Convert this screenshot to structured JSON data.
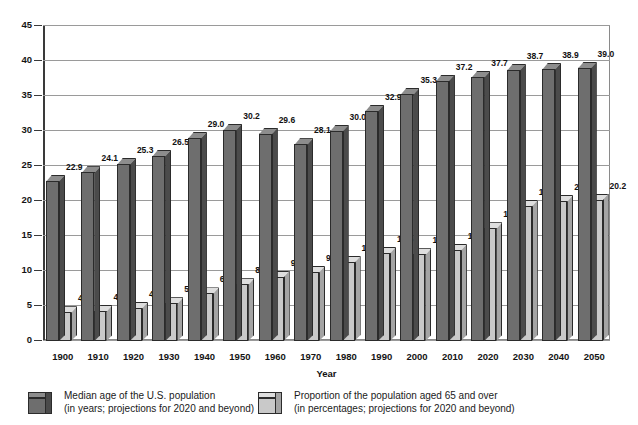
{
  "chart_data": {
    "type": "bar",
    "title": "",
    "subtitle": "",
    "xlabel": "Year",
    "ylabel": "",
    "ylim": [
      0,
      45
    ],
    "grid": true,
    "legend_position": "bottom",
    "categories": [
      "1900",
      "1910",
      "1920",
      "1930",
      "1940",
      "1950",
      "1960",
      "1970",
      "1980",
      "1990",
      "2000",
      "2010",
      "2020",
      "2030",
      "2040",
      "2050"
    ],
    "yticks": [
      "0",
      "5",
      "10",
      "15",
      "20",
      "25",
      "30",
      "35",
      "40",
      "45"
    ],
    "series": [
      {
        "name": "Median age of the U.S. population",
        "note": "(in years; projections for 2020 and beyond)",
        "color": "#6e6e6e",
        "values": [
          22.9,
          24.1,
          25.3,
          26.5,
          29.0,
          30.2,
          29.6,
          28.1,
          30.0,
          32.9,
          35.3,
          37.2,
          37.7,
          38.7,
          38.9,
          39.0
        ],
        "labels": [
          "22.9",
          "24.1",
          "25.3",
          "26.5",
          "29.0",
          "30.2",
          "29.6",
          "28.1",
          "30.0",
          "32.9",
          "35.3",
          "37.2",
          "37.7",
          "38.7",
          "38.9",
          "39.0"
        ]
      },
      {
        "name": "Proportion of the population aged 65 and over",
        "note": "(in percentages; projections for 2020 and beyond)",
        "color": "#c9c9c9",
        "values": [
          4.1,
          4.3,
          4.7,
          5.4,
          6.8,
          8.1,
          9.2,
          9.9,
          11.3,
          12.6,
          12.4,
          13.0,
          16.1,
          19.3,
          20.0,
          20.2
        ],
        "labels": [
          "4.1",
          "4.3",
          "4.7",
          "5.4",
          "6.8",
          "8.1",
          "9.2",
          "9.9",
          "11.3",
          "12.6",
          "12.4",
          "13.0",
          "16.1",
          "19.3",
          "20.0",
          "20.2"
        ]
      }
    ]
  },
  "axis": {
    "x_title": "Year"
  },
  "legend": {
    "items": [
      {
        "line1": "Median age of the U.S. population",
        "line2": "(in years; projections for 2020 and beyond)",
        "swatch": "dark-cube-icon"
      },
      {
        "line1": "Proportion of the population aged 65 and over",
        "line2": "(in percentages; projections for 2020 and beyond)",
        "swatch": "light-cube-icon"
      }
    ]
  },
  "colors": {
    "dark_front": "#6e6e6e",
    "dark_top": "#8d8d8d",
    "dark_side": "#4b4b4b",
    "light_front": "#c9c9c9",
    "light_top": "#dedede",
    "light_side": "#a4a4a4",
    "gridline": "#9a9a9a",
    "frame": "#8a8a8a"
  }
}
